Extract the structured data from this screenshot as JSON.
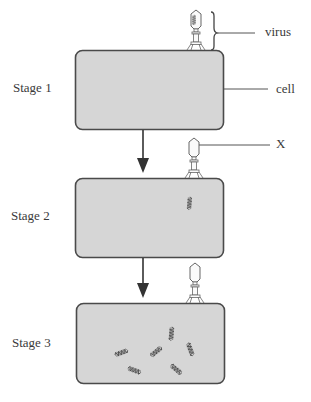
{
  "stages": [
    {
      "label": "Stage 1",
      "virus_state": "attached-full"
    },
    {
      "label": "Stage 2",
      "virus_state": "empty-injected"
    },
    {
      "label": "Stage 3",
      "virus_state": "empty-replicating"
    }
  ],
  "callouts": {
    "virus": "virus",
    "cell": "cell",
    "x": "X"
  },
  "colors": {
    "cell_fill": "#d6d6d6",
    "cell_stroke": "#4a4a4a",
    "line": "#555555"
  }
}
